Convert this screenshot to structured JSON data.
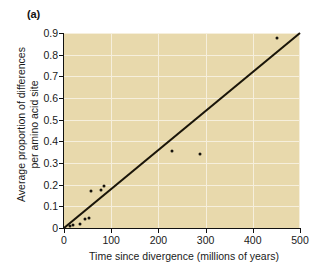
{
  "figure": {
    "panel_label": "(a)",
    "background_color": "#ffffff",
    "plot_background_color": "#e8d9ac",
    "gridline_color": "#f6efdc",
    "axis_color": "#111111",
    "point_color": "#15120c",
    "line_color": "#1a1509"
  },
  "chart_data": {
    "type": "scatter",
    "title": "(a)",
    "xlabel": "Time since divergence (millions of years)",
    "ylabel": "Average proportion of differences per amino acid site",
    "ylabel_line1": "Average proportion of differences",
    "ylabel_line2": "per amino acid site",
    "xlim": [
      0,
      500
    ],
    "ylim": [
      0,
      0.9
    ],
    "xticks": [
      0,
      100,
      200,
      300,
      400,
      500
    ],
    "yticks": [
      0,
      0.1,
      0.2,
      0.3,
      0.4,
      0.5,
      0.6,
      0.7,
      0.8,
      0.9
    ],
    "xtick_labels": [
      "0",
      "100",
      "200",
      "300",
      "400",
      "500"
    ],
    "ytick_labels": [
      "0",
      "0.1",
      "0.2",
      "0.3",
      "0.4",
      "0.5",
      "0.6",
      "0.7",
      "0.8",
      "0.9"
    ],
    "grid": true,
    "legend": false,
    "points": [
      {
        "x": 12,
        "y": 0.01
      },
      {
        "x": 20,
        "y": 0.013
      },
      {
        "x": 33,
        "y": 0.018
      },
      {
        "x": 45,
        "y": 0.04
      },
      {
        "x": 52,
        "y": 0.045
      },
      {
        "x": 58,
        "y": 0.172
      },
      {
        "x": 78,
        "y": 0.175
      },
      {
        "x": 84,
        "y": 0.193
      },
      {
        "x": 228,
        "y": 0.355
      },
      {
        "x": 288,
        "y": 0.343
      },
      {
        "x": 452,
        "y": 0.877
      }
    ],
    "trendline": {
      "label": "regression line",
      "x_start": 0,
      "y_start": 0.0,
      "x_end": 500,
      "y_end": 0.9
    }
  }
}
